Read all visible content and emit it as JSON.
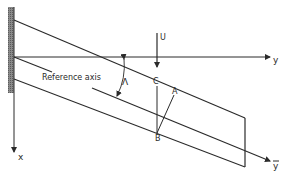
{
  "figure": {
    "labels": {
      "x_axis": "x",
      "y_axis": "y",
      "y_bar_axis": "y",
      "freestream": "U",
      "reference_axis": "Reference axis",
      "sweep_angle": "Λ",
      "point_a": "A",
      "point_b": "B",
      "point_c": "C"
    },
    "colors": {
      "line": "#2a2a2a",
      "wall": "#7a7a7a",
      "background": "#ffffff"
    }
  }
}
